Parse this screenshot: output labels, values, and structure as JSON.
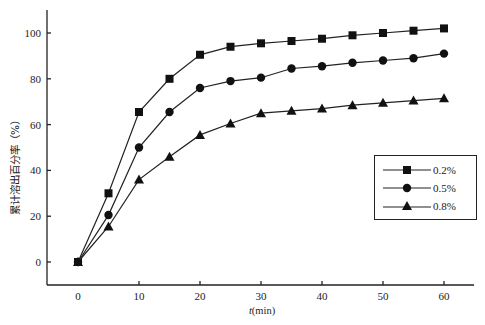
{
  "chart_data": {
    "type": "line",
    "title": "",
    "xlabel": "t(min)",
    "xlabel_var": "t",
    "xlabel_unit": "(min)",
    "ylabel": "累计溶出百分率（%）",
    "x": [
      0,
      5,
      10,
      15,
      20,
      25,
      30,
      35,
      40,
      45,
      50,
      55,
      60
    ],
    "series": [
      {
        "name": "0.2%",
        "marker": "square",
        "values": [
          0,
          30,
          65.5,
          80,
          90.5,
          94,
          95.5,
          96.5,
          97.5,
          99,
          100,
          101,
          102
        ]
      },
      {
        "name": "0.5%",
        "marker": "circle",
        "values": [
          0,
          20.5,
          50,
          65.5,
          76,
          79,
          80.5,
          84.5,
          85.5,
          87,
          88,
          89,
          91
        ]
      },
      {
        "name": "0.8%",
        "marker": "triangle",
        "values": [
          0,
          15.5,
          36,
          46,
          55.5,
          60.5,
          65,
          66,
          67,
          68.5,
          69.5,
          70.5,
          71.5
        ]
      }
    ],
    "xticks": [
      0,
      10,
      20,
      30,
      40,
      50,
      60
    ],
    "yticks": [
      0,
      20,
      40,
      60,
      80,
      100
    ],
    "xlim": [
      -5,
      65
    ],
    "ylim": [
      -10,
      110
    ],
    "grid": false,
    "legend_position": "right-center"
  },
  "axes": {
    "xtick_labels": [
      "0",
      "10",
      "20",
      "30",
      "40",
      "50",
      "60"
    ],
    "ytick_labels": [
      "0",
      "20",
      "40",
      "60",
      "80",
      "100"
    ]
  },
  "legend": {
    "items": [
      {
        "label": "0.2%",
        "marker": "square-icon"
      },
      {
        "label": "0.5%",
        "marker": "circle-icon"
      },
      {
        "label": "0.8%",
        "marker": "triangle-icon"
      }
    ]
  },
  "colors": {
    "line": "#222222",
    "marker": "#111111",
    "background": "#ffffff"
  }
}
